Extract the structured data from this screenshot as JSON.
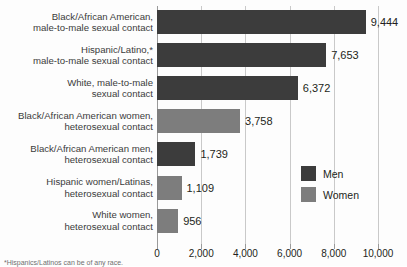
{
  "chart_data": {
    "type": "bar",
    "orientation": "horizontal",
    "title": "",
    "xlabel": "",
    "ylabel": "",
    "xlim": [
      0,
      10000
    ],
    "grid": true,
    "legend_position": "inside-right",
    "categories": [
      "Black/African American,\nmale-to-male sexual contact",
      "Hispanic/Latino,*\nmale-to-male sexual contact",
      "White, male-to-male\nsexual contact",
      "Black/African American women,\nheterosexual contact",
      "Black/African American men,\nheterosexual contact",
      "Hispanic women/Latinas,\nheterosexual contact",
      "White women,\nheterosexual contact"
    ],
    "values": [
      9444,
      7653,
      6372,
      3758,
      1739,
      1109,
      956
    ],
    "value_labels": [
      "9,444",
      "7,653",
      "6,372",
      "3,758",
      "1,739",
      "1,109",
      "956"
    ],
    "group": [
      "Men",
      "Men",
      "Men",
      "Women",
      "Men",
      "Women",
      "Women"
    ],
    "ticks": [
      0,
      2000,
      4000,
      6000,
      8000,
      10000
    ],
    "tick_labels": [
      "0",
      "2,000",
      "4,000",
      "6,000",
      "8,000",
      "10,000"
    ],
    "series": [
      {
        "name": "Men",
        "color": "#3c3c3c"
      },
      {
        "name": "Women",
        "color": "#7d7d7d"
      }
    ]
  },
  "legend": {
    "items": [
      {
        "label": "Men",
        "color": "#3c3c3c"
      },
      {
        "label": "Women",
        "color": "#7d7d7d"
      }
    ]
  },
  "footnote": {
    "text": "*Hispanics/Latinos can be of any race."
  },
  "colors": {
    "men": "#3c3c3c",
    "women": "#7d7d7d",
    "gridline": "#c9c9c9",
    "axis": "#9a9a9a",
    "text": "#231f20",
    "background": "#fdfdfd"
  }
}
